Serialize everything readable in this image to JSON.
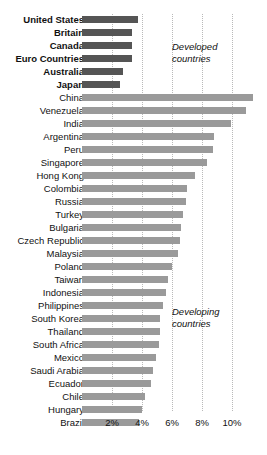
{
  "chart_data": {
    "type": "bar",
    "orientation": "horizontal",
    "title": "",
    "xlabel": "",
    "ylabel": "",
    "xlim": [
      0,
      11.5
    ],
    "grid": true,
    "xticks": [
      2,
      4,
      6,
      8,
      10
    ],
    "xticklabels": [
      "2%",
      "4%",
      "6%",
      "8%",
      "10%"
    ],
    "legend_position": "none",
    "annotations": [
      {
        "id": "developed",
        "text": "Developed\ncountries",
        "line1": "Developed",
        "line2": "countries"
      },
      {
        "id": "developing",
        "text": "Developing\ncountries",
        "line1": "Developing",
        "line2": "countries"
      }
    ],
    "colors": {
      "developed_bar": "#555555",
      "developing_bar": "#9a9a9a",
      "gridline": "#b9b9b9",
      "text": "#111111",
      "background": "#ffffff"
    },
    "groups": [
      "Developed countries",
      "Developing countries"
    ],
    "categories": [
      "United States",
      "Britain",
      "Canada",
      "Euro Countries",
      "Australia",
      "Japan",
      "China",
      "Venezuela",
      "India",
      "Argentina",
      "Peru",
      "Singapore",
      "Hong Kong",
      "Colombia",
      "Russia",
      "Turkey",
      "Bulgaria",
      "Czech Republic",
      "Malaysia",
      "Poland",
      "Taiwan",
      "Indonesia",
      "Philippines",
      "South Korea",
      "Thailand",
      "South Africa",
      "Mexico",
      "Saudi Arabia",
      "Ecuador",
      "Chile",
      "Hungary",
      "Brazil"
    ],
    "values": [
      3.7,
      3.3,
      3.3,
      3.3,
      2.7,
      2.5,
      11.4,
      10.9,
      9.9,
      8.8,
      8.7,
      8.3,
      7.5,
      7.0,
      6.9,
      6.7,
      6.6,
      6.5,
      6.4,
      6.0,
      5.7,
      5.6,
      5.4,
      5.2,
      5.2,
      5.1,
      4.9,
      4.7,
      4.6,
      4.2,
      4.0,
      3.8
    ],
    "bars": [
      {
        "label": "United States",
        "value": 3.7,
        "group": "developed"
      },
      {
        "label": "Britain",
        "value": 3.3,
        "group": "developed"
      },
      {
        "label": "Canada",
        "value": 3.3,
        "group": "developed"
      },
      {
        "label": "Euro Countries",
        "value": 3.3,
        "group": "developed"
      },
      {
        "label": "Australia",
        "value": 2.7,
        "group": "developed"
      },
      {
        "label": "Japan",
        "value": 2.5,
        "group": "developed"
      },
      {
        "label": "China",
        "value": 11.4,
        "group": "developing"
      },
      {
        "label": "Venezuela",
        "value": 10.9,
        "group": "developing"
      },
      {
        "label": "India",
        "value": 9.9,
        "group": "developing"
      },
      {
        "label": "Argentina",
        "value": 8.8,
        "group": "developing"
      },
      {
        "label": "Peru",
        "value": 8.7,
        "group": "developing"
      },
      {
        "label": "Singapore",
        "value": 8.3,
        "group": "developing"
      },
      {
        "label": "Hong Kong",
        "value": 7.5,
        "group": "developing"
      },
      {
        "label": "Colombia",
        "value": 7.0,
        "group": "developing"
      },
      {
        "label": "Russia",
        "value": 6.9,
        "group": "developing"
      },
      {
        "label": "Turkey",
        "value": 6.7,
        "group": "developing"
      },
      {
        "label": "Bulgaria",
        "value": 6.6,
        "group": "developing"
      },
      {
        "label": "Czech Republic",
        "value": 6.5,
        "group": "developing"
      },
      {
        "label": "Malaysia",
        "value": 6.4,
        "group": "developing"
      },
      {
        "label": "Poland",
        "value": 6.0,
        "group": "developing"
      },
      {
        "label": "Taiwan",
        "value": 5.7,
        "group": "developing"
      },
      {
        "label": "Indonesia",
        "value": 5.6,
        "group": "developing"
      },
      {
        "label": "Philippines",
        "value": 5.4,
        "group": "developing"
      },
      {
        "label": "South Korea",
        "value": 5.2,
        "group": "developing"
      },
      {
        "label": "Thailand",
        "value": 5.2,
        "group": "developing"
      },
      {
        "label": "South Africa",
        "value": 5.1,
        "group": "developing"
      },
      {
        "label": "Mexico",
        "value": 4.9,
        "group": "developing"
      },
      {
        "label": "Saudi Arabia",
        "value": 4.7,
        "group": "developing"
      },
      {
        "label": "Ecuador",
        "value": 4.6,
        "group": "developing"
      },
      {
        "label": "Chile",
        "value": 4.2,
        "group": "developing"
      },
      {
        "label": "Hungary",
        "value": 4.0,
        "group": "developing"
      },
      {
        "label": "Brazil",
        "value": 3.8,
        "group": "developing"
      }
    ]
  }
}
